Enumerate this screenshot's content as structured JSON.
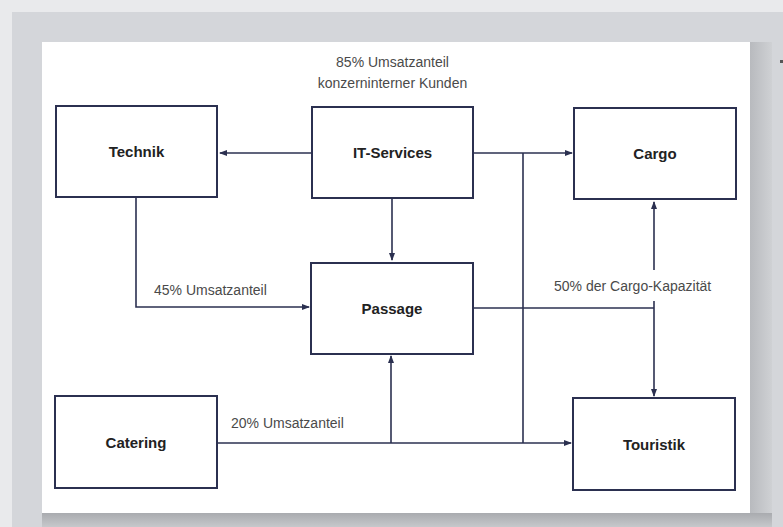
{
  "diagram": {
    "nodes": [
      {
        "id": "technik",
        "label": "Technik"
      },
      {
        "id": "it_services",
        "label": "IT-Services"
      },
      {
        "id": "cargo",
        "label": "Cargo"
      },
      {
        "id": "passage",
        "label": "Passage"
      },
      {
        "id": "catering",
        "label": "Catering"
      },
      {
        "id": "touristik",
        "label": "Touristik"
      }
    ],
    "annotations": {
      "it_services_line1": "85% Umsatzanteil",
      "it_services_line2": "konzerninterner Kunden",
      "technik_to_passage": "45% Umsatzanteil",
      "catering_to_passage": "20% Umsatzanteil",
      "cargo_capacity": "50% der Cargo-Kapazität"
    },
    "edges": [
      {
        "from": "it_services",
        "to": "technik"
      },
      {
        "from": "it_services",
        "to": "cargo"
      },
      {
        "from": "it_services",
        "to": "passage"
      },
      {
        "from": "it_services",
        "to": "touristik"
      },
      {
        "from": "technik",
        "to": "passage",
        "label": "45% Umsatzanteil"
      },
      {
        "from": "catering",
        "to": "passage",
        "label": "20% Umsatzanteil"
      },
      {
        "from": "catering",
        "to": "touristik"
      },
      {
        "from": "passage",
        "to": "cargo",
        "label": "50% der Cargo-Kapazität"
      },
      {
        "from": "passage",
        "to": "touristik"
      }
    ],
    "colors": {
      "line": "#2b3050",
      "text": "#222222",
      "label": "#4a4a4a",
      "background": "#d4d6da"
    }
  }
}
